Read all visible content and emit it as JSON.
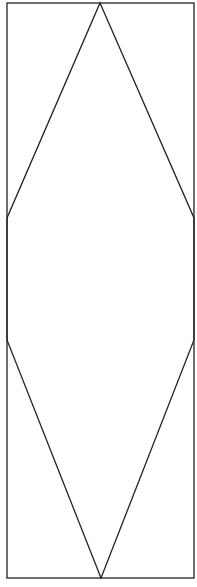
{
  "diagram": {
    "canvas": {
      "width": 197,
      "height": 587,
      "background": "#ffffff"
    },
    "stroke_color": "#222222",
    "stroke_width": 1.3,
    "frame": {
      "x": 7,
      "y": 3,
      "width": 187,
      "height": 575
    },
    "hexagon": {
      "points": [
        [
          100,
          3
        ],
        [
          194,
          218
        ],
        [
          194,
          340
        ],
        [
          101,
          578
        ],
        [
          7,
          340
        ],
        [
          7,
          218
        ]
      ]
    }
  }
}
